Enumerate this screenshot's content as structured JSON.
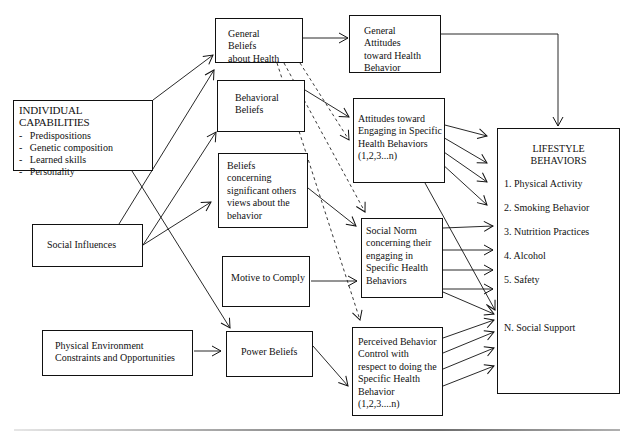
{
  "diagram": {
    "individual_capabilities": {
      "title": "INDIVIDUAL CAPABILITIES",
      "items": [
        "Predispositions",
        "Genetic composition",
        "Learned skills",
        "Personality"
      ]
    },
    "social_influences": "Social Influences",
    "physical_environment": [
      "Physical Environment",
      "Constraints and Opportunities"
    ],
    "general_beliefs": [
      "General Beliefs",
      "about Health"
    ],
    "behavioral_beliefs": [
      "Behavioral",
      "Beliefs"
    ],
    "beliefs_concerning": [
      "Beliefs concerning",
      "significant others",
      "views about the",
      "behavior"
    ],
    "motive_to_comply": "Motive to Comply",
    "power_beliefs": "Power Beliefs",
    "general_attitudes": [
      "General Attitudes",
      "toward Health",
      "Behavior"
    ],
    "attitudes_engaging": [
      "Attitudes toward",
      "Engaging in Specific",
      "Health Behaviors",
      "(1,2,3...n)"
    ],
    "social_norm": [
      "Social Norm",
      "concerning their",
      "engaging in",
      "Specific Health",
      "Behaviors"
    ],
    "perceived_control": [
      "Perceived Behavior",
      "Control with",
      "respect to doing the",
      "Specific Health",
      "Behavior",
      "(1,2,3....n)"
    ],
    "lifestyle_behaviors": {
      "title": [
        "LIFESTYLE",
        "BEHAVIORS"
      ],
      "items": [
        "1.  Physical Activity",
        "2.  Smoking Behavior",
        "3.  Nutrition Practices",
        "4.  Alcohol",
        "5.  Safety",
        "N. Social Support"
      ]
    },
    "colors": {
      "line": "#111111",
      "background": "#ffffff"
    }
  }
}
